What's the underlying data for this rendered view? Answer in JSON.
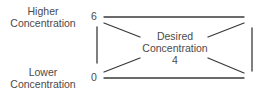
{
  "labels": {
    "higher_line1": "Higher",
    "higher_line2": "Concentration",
    "lower_line1": "Lower",
    "lower_line2": "Concentration",
    "tick_top": "6",
    "tick_bottom": "0",
    "desired_line1": "Desired",
    "desired_line2": "Concentration",
    "desired_value": "4"
  },
  "colors": {
    "line": "#3a3a3a",
    "text": "#4a4a4a",
    "background": "#ffffff"
  }
}
